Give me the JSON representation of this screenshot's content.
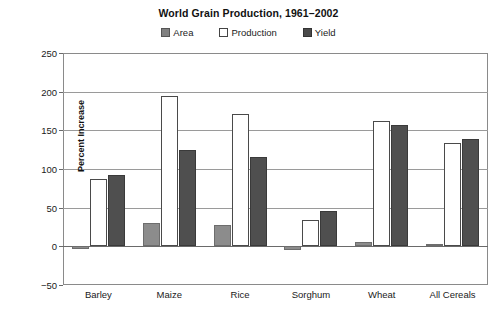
{
  "chart_data": {
    "type": "bar",
    "title": "World Grain Production, 1961–2002",
    "xlabel": "",
    "ylabel": "Percent Increase",
    "categories": [
      "Barley",
      "Maize",
      "Rice",
      "Sorghum",
      "Wheat",
      "All Cereals"
    ],
    "series": [
      {
        "name": "Area",
        "color": "#8c8c8c",
        "values": [
          -4,
          30,
          28,
          -5,
          5,
          3
        ]
      },
      {
        "name": "Production",
        "color": "#ffffff",
        "values": [
          87,
          195,
          171,
          34,
          162,
          134
        ]
      },
      {
        "name": "Yield",
        "color": "#4f4f4f",
        "values": [
          92,
          124,
          116,
          46,
          157,
          139
        ]
      }
    ],
    "ylim": [
      -50,
      250
    ],
    "yticks": [
      250,
      200,
      150,
      100,
      50,
      0,
      -50
    ],
    "ytick_labels": [
      "250",
      "200",
      "150",
      "100",
      "50",
      "0",
      "−50"
    ],
    "grid": true,
    "grid_axis": "y",
    "legend_position": "top-center"
  },
  "legend": {
    "entries": [
      {
        "label": "Area",
        "swatch": "swatch-area-icon"
      },
      {
        "label": "Production",
        "swatch": "swatch-production-icon"
      },
      {
        "label": "Yield",
        "swatch": "swatch-yield-icon"
      }
    ]
  }
}
